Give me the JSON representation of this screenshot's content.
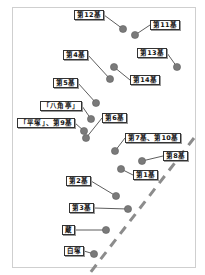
{
  "map": {
    "frame_color": "#cfcfcf",
    "dot_color": "#7a7a7a",
    "dashed_line_color": "#8c8c8c",
    "markers": [
      {
        "id": "m12",
        "label": "第12基",
        "label_pos": [
          74,
          10
        ],
        "dot": [
          123,
          29
        ]
      },
      {
        "id": "m11",
        "label": "第11基",
        "label_pos": [
          150,
          20
        ],
        "dot": [
          135,
          35
        ]
      },
      {
        "id": "m4",
        "label": "第4基",
        "label_pos": [
          63,
          50
        ],
        "dot": [
          110,
          79
        ]
      },
      {
        "id": "m13",
        "label": "第13基",
        "label_pos": [
          137,
          48
        ],
        "dot": [
          177,
          67
        ]
      },
      {
        "id": "m14",
        "label": "第14基",
        "label_pos": [
          130,
          75
        ],
        "dot": [
          114,
          67
        ]
      },
      {
        "id": "m5",
        "label": "第5基",
        "label_pos": [
          53,
          78
        ],
        "dot": [
          96,
          103
        ]
      },
      {
        "id": "hakkakutei",
        "label": "「八角亭」",
        "label_pos": [
          40,
          101
        ],
        "dot": [
          91,
          119
        ]
      },
      {
        "id": "m6",
        "label": "第6基",
        "label_pos": [
          102,
          113
        ],
        "dot": [
          86,
          138
        ]
      },
      {
        "id": "hiratsuka-m9",
        "label": "「平塚」、第9基",
        "label_pos": [
          17,
          118
        ],
        "dot": [
          84,
          131
        ]
      },
      {
        "id": "m7-m10",
        "label": "第7基、第10基",
        "label_pos": [
          125,
          133
        ],
        "dot": [
          115,
          151
        ]
      },
      {
        "id": "m8",
        "label": "第8基",
        "label_pos": [
          163,
          151
        ],
        "dot": [
          142,
          161
        ]
      },
      {
        "id": "m1",
        "label": "第1基",
        "label_pos": [
          133,
          170
        ],
        "dot": [
          121,
          169
        ]
      },
      {
        "id": "m2",
        "label": "第2基",
        "label_pos": [
          66,
          176
        ],
        "dot": [
          116,
          196
        ]
      },
      {
        "id": "m3",
        "label": "第3基",
        "label_pos": [
          69,
          203
        ],
        "dot": [
          128,
          209
        ]
      },
      {
        "id": "kura",
        "label": "蔵",
        "label_pos": [
          62,
          225
        ],
        "dot": [
          106,
          230
        ]
      },
      {
        "id": "shirotsuka",
        "label": "白塚",
        "label_pos": [
          64,
          246
        ],
        "dot": [
          94,
          254
        ]
      }
    ],
    "dashed_line": {
      "from": [
        194,
        138
      ],
      "to": [
        90,
        273
      ]
    }
  }
}
